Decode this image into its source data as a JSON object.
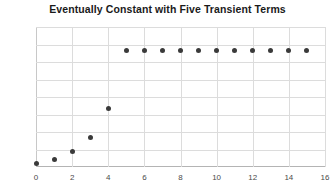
{
  "chart_data": {
    "type": "scatter",
    "title": "Eventually Constant with Five Transient Terms",
    "xlabel": "",
    "ylabel": "",
    "x": [
      0,
      1,
      2,
      3,
      4,
      5,
      6,
      7,
      8,
      9,
      10,
      11,
      12,
      13,
      14,
      15
    ],
    "values": [
      0.022,
      0.045,
      0.088,
      0.167,
      0.333,
      0.667,
      0.667,
      0.667,
      0.667,
      0.667,
      0.667,
      0.667,
      0.667,
      0.667,
      0.667,
      0.667
    ],
    "series": [
      {
        "name": "sequence",
        "values": [
          0.022,
          0.045,
          0.088,
          0.167,
          0.333,
          0.667,
          0.667,
          0.667,
          0.667,
          0.667,
          0.667,
          0.667,
          0.667,
          0.667,
          0.667,
          0.667
        ]
      }
    ],
    "xlim": [
      0,
      16
    ],
    "ylim": [
      0,
      0.8
    ],
    "xticks": [
      0,
      2,
      4,
      6,
      8,
      10,
      12,
      14,
      16
    ],
    "xtick_labels": [
      "0",
      "2",
      "4",
      "6",
      "8",
      "10",
      "12",
      "14",
      "16"
    ],
    "yticks": [
      0,
      0.1,
      0.2,
      0.3,
      0.4,
      0.5,
      0.6,
      0.7,
      0.8
    ],
    "ytick_labels": [
      "0",
      "0.1",
      "0.2",
      "0.3",
      "0.4",
      "0.5",
      "0.6",
      "0.7",
      "0.8"
    ],
    "grid": true,
    "legend": false,
    "marker_color": "#3a3a3a",
    "grid_color": "#dcdcdc",
    "axis_color": "#b4b4b4",
    "background_color": "#ffffff",
    "transient_count": 5,
    "constant_value": 0.667
  }
}
